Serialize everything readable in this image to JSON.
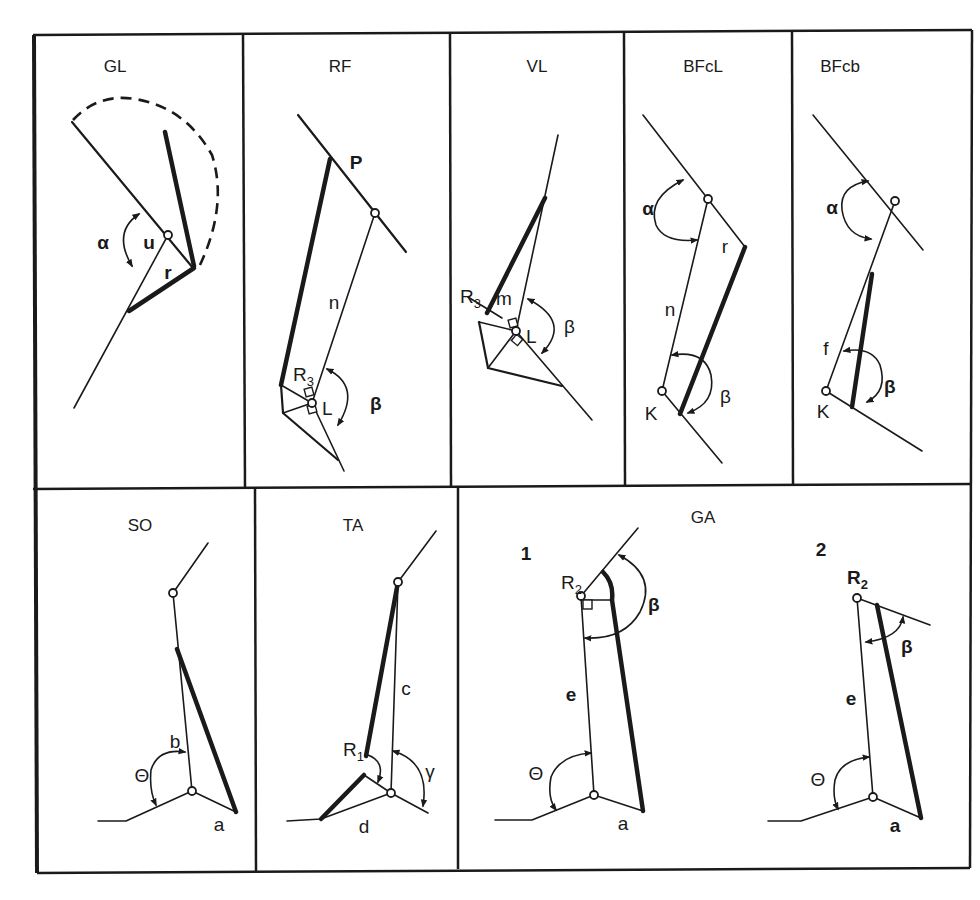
{
  "figure": {
    "panels": [
      {
        "id": "GL",
        "title": "GL",
        "labels": {
          "angle": "α",
          "segment_u": "u",
          "segment_r": "r"
        }
      },
      {
        "id": "RF",
        "title": "RF",
        "labels": {
          "point_p": "P",
          "segment_n": "n",
          "moment_arm": "R",
          "moment_arm_sub": "3",
          "point_l": "L",
          "angle": "β"
        }
      },
      {
        "id": "VL",
        "title": "VL",
        "labels": {
          "moment_arm": "R",
          "moment_arm_sub": "3",
          "segment_m": "m",
          "point_l": "L",
          "angle": "β"
        }
      },
      {
        "id": "BFcL",
        "title": "BFcL",
        "labels": {
          "angle_top": "α",
          "segment_r": "r",
          "segment_n": "n",
          "point_k": "K",
          "angle_bottom": "β"
        }
      },
      {
        "id": "BFcb",
        "title": "BFcb",
        "labels": {
          "angle_top": "α",
          "segment_f": "f",
          "point_k": "K",
          "angle_bottom": "β"
        }
      },
      {
        "id": "SO",
        "title": "SO",
        "labels": {
          "segment_b": "b",
          "angle": "Θ",
          "segment_a": "a"
        }
      },
      {
        "id": "TA",
        "title": "TA",
        "labels": {
          "segment_c": "c",
          "moment_arm": "R",
          "moment_arm_sub": "1",
          "angle": "γ",
          "segment_d": "d"
        }
      },
      {
        "id": "GA",
        "title": "GA",
        "sub_panels": [
          {
            "number": "1",
            "labels": {
              "moment_arm": "R",
              "moment_arm_sub": "2",
              "angle_top": "β",
              "segment_e": "e",
              "angle_bottom": "Θ",
              "segment_a": "a"
            }
          },
          {
            "number": "2",
            "labels": {
              "moment_arm": "R",
              "moment_arm_sub": "2",
              "angle_top": "β",
              "segment_e": "e",
              "angle_bottom": "Θ",
              "segment_a": "a"
            }
          }
        ]
      }
    ]
  }
}
